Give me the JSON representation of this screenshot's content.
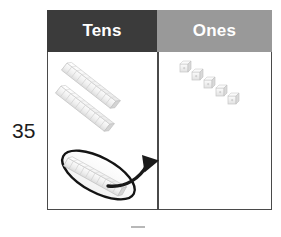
{
  "diagram": {
    "number_label": "35",
    "columns": [
      {
        "key": "tens",
        "label": "Tens",
        "header_bg": "#3b3b3b",
        "header_text_color": "#ffffff",
        "block_type": "ten-rod",
        "block_count": 3,
        "highlighted_block_count": 1,
        "value": 30
      },
      {
        "key": "ones",
        "label": "Ones",
        "header_bg": "#999999",
        "header_text_color": "#ffffff",
        "block_type": "unit-cube",
        "block_count": 5,
        "value": 5
      }
    ],
    "annotation": {
      "circle_label": "highlighted ten rod being regrouped",
      "arrow_label": "regroup arrow from tens to ones",
      "arrow_color": "#1a1a1a",
      "circle_color": "#1a1a1a"
    },
    "colors": {
      "table_border": "#4a4a4a",
      "block_fill": "#f0f0f0",
      "block_shade": "#d8d8d8",
      "block_edge": "#bdbdbd",
      "number_text": "#1c1c1c",
      "background": "#ffffff"
    }
  }
}
